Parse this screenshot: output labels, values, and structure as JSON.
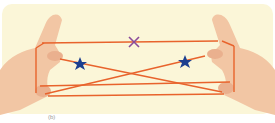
{
  "figure": {
    "colors": {
      "background": "#fbf6d8",
      "string": "#e8632c",
      "skin": "#f2c6a4",
      "cross_marker": "#8a4a9a",
      "star_marker": "#1d3f8f"
    },
    "markers": [
      {
        "type": "cross",
        "label": "×"
      },
      {
        "type": "star",
        "label": "★"
      },
      {
        "type": "star",
        "label": "★"
      }
    ],
    "caption": "(b)"
  }
}
